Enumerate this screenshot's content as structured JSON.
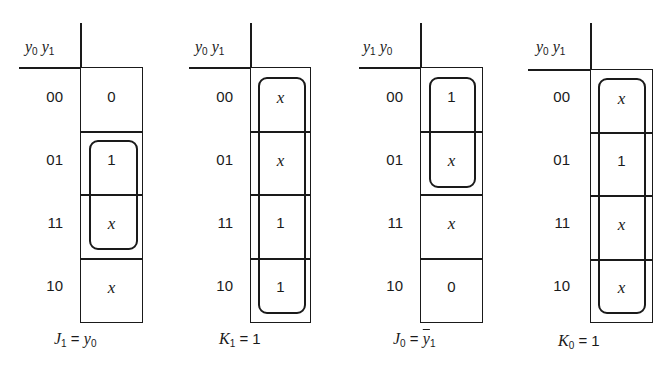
{
  "row_labels": [
    "00",
    "01",
    "11",
    "10"
  ],
  "maps": [
    {
      "id": "J1",
      "header": {
        "a": "y",
        "a_sub": "0",
        "b": "y",
        "b_sub": "1"
      },
      "cells": [
        "0",
        "1",
        "x",
        "x"
      ],
      "grouping": {
        "rows": [
          1,
          2
        ]
      },
      "equation": {
        "lhs": "J",
        "lhs_sub": "1",
        "eq": " = ",
        "rhs": "y",
        "rhs_sub": "0"
      }
    },
    {
      "id": "K1",
      "header": {
        "a": "y",
        "a_sub": "0",
        "b": "y",
        "b_sub": "1"
      },
      "cells": [
        "x",
        "x",
        "1",
        "1"
      ],
      "grouping": {
        "rows": [
          0,
          1,
          2,
          3
        ]
      },
      "equation": {
        "lhs": "K",
        "lhs_sub": "1",
        "eq": " = ",
        "rhs_num": "1"
      }
    },
    {
      "id": "J0",
      "header": {
        "a": "y",
        "a_sub": "1",
        "b": "y",
        "b_sub": "0"
      },
      "cells": [
        "1",
        "x",
        "x",
        "0"
      ],
      "grouping": {
        "rows": [
          0,
          1
        ]
      },
      "equation": {
        "lhs": "J",
        "lhs_sub": "0",
        "eq": " = ",
        "rhs": "y",
        "rhs_sub": "1",
        "rhs_complement": true
      }
    },
    {
      "id": "K0",
      "header": {
        "a": "y",
        "a_sub": "0",
        "b": "y",
        "b_sub": "1"
      },
      "cells": [
        "x",
        "1",
        "x",
        "x"
      ],
      "grouping": {
        "rows": [
          0,
          1,
          2,
          3
        ]
      },
      "equation": {
        "lhs": "K",
        "lhs_sub": "0",
        "eq": " = ",
        "rhs_num": "1"
      }
    }
  ]
}
